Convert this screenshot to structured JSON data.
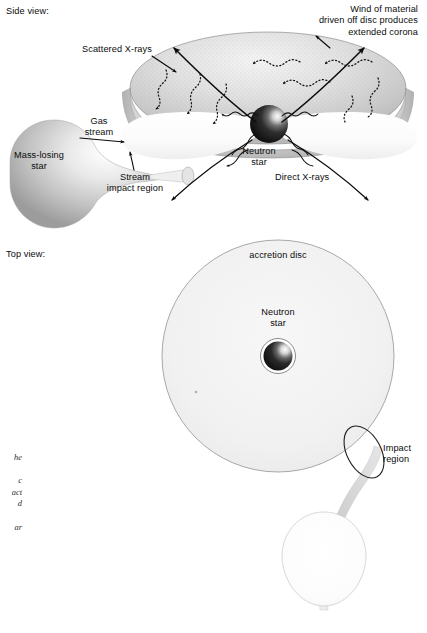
{
  "figure": {
    "background_color": "#ffffff",
    "ink_color": "#0b0b0b"
  },
  "views": {
    "side": {
      "label": "Side view:"
    },
    "top": {
      "label": "Top view:"
    }
  },
  "side_view": {
    "labels": {
      "wind": "Wind of material\ndriven off disc produces\nextended corona",
      "scattered_xrays": "Scattered X-rays",
      "gas_stream": "Gas\nstream",
      "mass_losing_star": "Mass-losing\nstar",
      "stream_impact_region": "Stream\nimpact region",
      "neutron_star": "Neutron\nstar",
      "direct_xrays": "Direct X-rays"
    },
    "colors": {
      "corona_fill": "#d8d8d8",
      "corona_edge": "#8a8a8a",
      "disc_fill": "#fbfbfb",
      "star_light": "#fdfdfd",
      "star_dark": "#8e8e8e",
      "neutron_dark": "#1a1a1a",
      "neutron_light": "#fafafa"
    }
  },
  "top_view": {
    "labels": {
      "accretion_disc": "accretion disc",
      "neutron_star": "Neutron\nstar",
      "impact_region": "Impact\nregion"
    },
    "colors": {
      "disc_fill": "#f2f2f2",
      "disc_edge": "#909090",
      "stream_fill": "#d9d9d9",
      "companion_edge": "#b5b5b5",
      "impact_ellipse_edge": "#1c1c1c"
    }
  },
  "caption": {
    "text": "he\n\nc\nact\nd\n\nar"
  }
}
